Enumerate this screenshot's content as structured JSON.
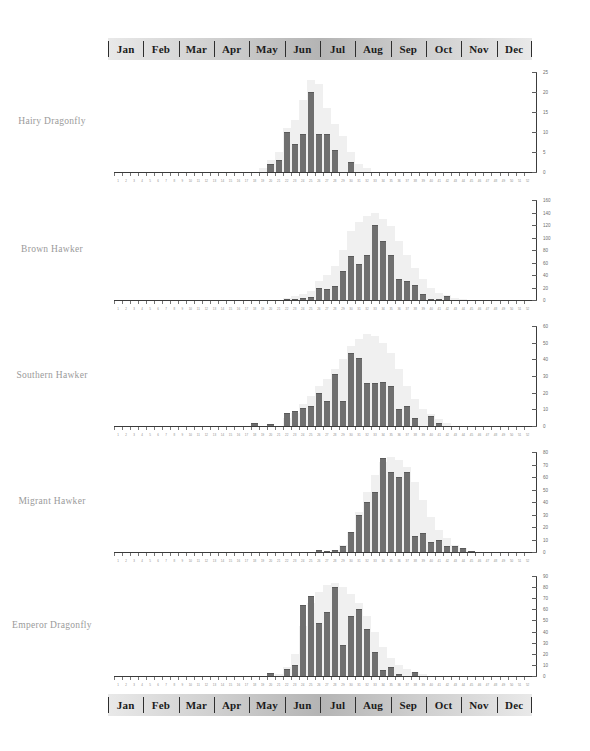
{
  "header": {
    "months": [
      "Jan",
      "Feb",
      "Mar",
      "Apr",
      "May",
      "Jun",
      "Jul",
      "Aug",
      "Sep",
      "Oct",
      "Nov",
      "Dec"
    ]
  },
  "footer": {
    "months": [
      "Jan",
      "Feb",
      "Mar",
      "Apr",
      "May",
      "Jun",
      "Jul",
      "Aug",
      "Sep",
      "Oct",
      "Nov",
      "Dec"
    ]
  },
  "colors": {
    "bar": "#6f6f6f",
    "halo": "#f0f0f0",
    "axis": "#3c3c3c",
    "label": "#9a9a9a",
    "bar_stroke": "#5a5a5a"
  },
  "chart_data": [
    {
      "type": "bar",
      "title": "Hairy Dragonfly",
      "xlabel": "",
      "ylabel": "",
      "ylim": [
        0,
        25
      ],
      "yticks": [
        0,
        5,
        10,
        15,
        20,
        25
      ],
      "grid": false,
      "categories": [
        "1",
        "2",
        "3",
        "4",
        "5",
        "6",
        "7",
        "8",
        "9",
        "10",
        "11",
        "12",
        "13",
        "14",
        "15",
        "16",
        "17",
        "18",
        "19",
        "20",
        "21",
        "22",
        "23",
        "24",
        "25",
        "26",
        "27",
        "28",
        "29",
        "30",
        "31",
        "32",
        "33",
        "34",
        "35",
        "36",
        "37",
        "38",
        "39",
        "40",
        "41",
        "42",
        "43",
        "44",
        "45",
        "46",
        "47",
        "48",
        "49",
        "50",
        "51",
        "52"
      ],
      "values": [
        0,
        0,
        0,
        0,
        0,
        0,
        0,
        0,
        0,
        0,
        0,
        0,
        0,
        0,
        0,
        0,
        0,
        0,
        0,
        2,
        3,
        10,
        7,
        9.5,
        20,
        9.5,
        9.5,
        5.5,
        0,
        2.5,
        0,
        0,
        0,
        0,
        0,
        0,
        0,
        0,
        0,
        0,
        0,
        0,
        0,
        0,
        0,
        0,
        0,
        0,
        0,
        0,
        0,
        0
      ],
      "envelope": [
        0,
        0,
        0,
        0,
        0,
        0,
        0,
        0,
        0,
        0,
        0,
        0,
        0,
        0,
        0,
        0,
        0,
        0,
        1,
        3,
        5,
        11,
        13,
        18,
        23,
        22,
        16,
        12,
        9,
        5,
        2,
        1,
        0,
        0,
        0,
        0,
        0,
        0,
        0,
        0,
        0,
        0,
        0,
        0,
        0,
        0,
        0,
        0,
        0,
        0,
        0,
        0
      ]
    },
    {
      "type": "bar",
      "title": "Brown Hawker",
      "xlabel": "",
      "ylabel": "",
      "ylim": [
        0,
        160
      ],
      "yticks": [
        0,
        20,
        40,
        60,
        80,
        100,
        120,
        140,
        160
      ],
      "grid": false,
      "categories": [
        "1",
        "2",
        "3",
        "4",
        "5",
        "6",
        "7",
        "8",
        "9",
        "10",
        "11",
        "12",
        "13",
        "14",
        "15",
        "16",
        "17",
        "18",
        "19",
        "20",
        "21",
        "22",
        "23",
        "24",
        "25",
        "26",
        "27",
        "28",
        "29",
        "30",
        "31",
        "32",
        "33",
        "34",
        "35",
        "36",
        "37",
        "38",
        "39",
        "40",
        "41",
        "42",
        "43",
        "44",
        "45",
        "46",
        "47",
        "48",
        "49",
        "50",
        "51",
        "52"
      ],
      "values": [
        0,
        0,
        0,
        0,
        0,
        0,
        0,
        0,
        0,
        0,
        0,
        0,
        0,
        0,
        0,
        0,
        0,
        0,
        0,
        0,
        0,
        2,
        2,
        4,
        5,
        20,
        17,
        22,
        46,
        70,
        58,
        72,
        120,
        94,
        72,
        34,
        31,
        24,
        10,
        2,
        2,
        6,
        0,
        0,
        0,
        0,
        0,
        0,
        0,
        0,
        0,
        0
      ],
      "envelope": [
        0,
        0,
        0,
        0,
        0,
        0,
        0,
        0,
        0,
        0,
        0,
        0,
        0,
        0,
        0,
        0,
        0,
        0,
        0,
        0,
        0,
        4,
        6,
        9,
        14,
        30,
        40,
        55,
        80,
        110,
        125,
        135,
        140,
        130,
        118,
        95,
        72,
        52,
        34,
        20,
        12,
        8,
        4,
        2,
        0,
        0,
        0,
        0,
        0,
        0,
        0,
        0
      ]
    },
    {
      "type": "bar",
      "title": "Southern Hawker",
      "xlabel": "",
      "ylabel": "",
      "ylim": [
        0,
        60
      ],
      "yticks": [
        0,
        10,
        20,
        30,
        40,
        50,
        60
      ],
      "grid": false,
      "categories": [
        "1",
        "2",
        "3",
        "4",
        "5",
        "6",
        "7",
        "8",
        "9",
        "10",
        "11",
        "12",
        "13",
        "14",
        "15",
        "16",
        "17",
        "18",
        "19",
        "20",
        "21",
        "22",
        "23",
        "24",
        "25",
        "26",
        "27",
        "28",
        "29",
        "30",
        "31",
        "32",
        "33",
        "34",
        "35",
        "36",
        "37",
        "38",
        "39",
        "40",
        "41",
        "42",
        "43",
        "44",
        "45",
        "46",
        "47",
        "48",
        "49",
        "50",
        "51",
        "52"
      ],
      "values": [
        0,
        0,
        0,
        0,
        0,
        0,
        0,
        0,
        0,
        0,
        0,
        0,
        0,
        0,
        0,
        0,
        0,
        2,
        0,
        1,
        0,
        8,
        9,
        11,
        12,
        20,
        15,
        31,
        15,
        44,
        41,
        26,
        26,
        26.5,
        24,
        10,
        12,
        5,
        0,
        6,
        2,
        0,
        0,
        0,
        0,
        0,
        0,
        0,
        0,
        0,
        0,
        0
      ],
      "envelope": [
        0,
        0,
        0,
        0,
        0,
        0,
        0,
        0,
        0,
        0,
        0,
        0,
        0,
        0,
        0,
        0,
        0,
        0,
        0,
        0,
        0,
        5,
        8,
        13,
        18,
        24,
        28,
        34,
        40,
        48,
        52,
        55,
        54,
        50,
        44,
        34,
        24,
        16,
        10,
        7,
        4,
        2,
        0,
        0,
        0,
        0,
        0,
        0,
        0,
        0,
        0,
        0
      ]
    },
    {
      "type": "bar",
      "title": "Migrant Hawker",
      "xlabel": "",
      "ylabel": "",
      "ylim": [
        0,
        80
      ],
      "yticks": [
        0,
        10,
        20,
        30,
        40,
        50,
        60,
        70,
        80
      ],
      "grid": false,
      "categories": [
        "1",
        "2",
        "3",
        "4",
        "5",
        "6",
        "7",
        "8",
        "9",
        "10",
        "11",
        "12",
        "13",
        "14",
        "15",
        "16",
        "17",
        "18",
        "19",
        "20",
        "21",
        "22",
        "23",
        "24",
        "25",
        "26",
        "27",
        "28",
        "29",
        "30",
        "31",
        "32",
        "33",
        "34",
        "35",
        "36",
        "37",
        "38",
        "39",
        "40",
        "41",
        "42",
        "43",
        "44",
        "45",
        "46",
        "47",
        "48",
        "49",
        "50",
        "51",
        "52"
      ],
      "values": [
        0,
        0,
        0,
        0,
        0,
        0,
        0,
        0,
        0,
        0,
        0,
        0,
        0,
        0,
        0,
        0,
        0,
        0,
        0,
        0,
        0,
        0,
        0,
        0,
        0,
        2,
        1,
        2,
        5,
        16,
        30,
        40,
        48,
        75,
        64,
        60,
        64,
        13,
        15,
        8,
        10,
        5,
        5,
        3,
        1,
        0,
        0,
        0,
        0,
        0,
        0,
        0
      ],
      "envelope": [
        0,
        0,
        0,
        0,
        0,
        0,
        0,
        0,
        0,
        0,
        0,
        0,
        0,
        0,
        0,
        0,
        0,
        0,
        0,
        0,
        0,
        0,
        0,
        0,
        0,
        0,
        0,
        2,
        6,
        16,
        32,
        48,
        62,
        72,
        76,
        74,
        68,
        56,
        42,
        28,
        18,
        11,
        6,
        3,
        1,
        0,
        0,
        0,
        0,
        0,
        0,
        0
      ]
    },
    {
      "type": "bar",
      "title": "Emperor  Dragonfly",
      "xlabel": "",
      "ylabel": "",
      "ylim": [
        0,
        90
      ],
      "yticks": [
        0,
        10,
        20,
        30,
        40,
        50,
        60,
        70,
        80,
        90
      ],
      "grid": false,
      "categories": [
        "1",
        "2",
        "3",
        "4",
        "5",
        "6",
        "7",
        "8",
        "9",
        "10",
        "11",
        "12",
        "13",
        "14",
        "15",
        "16",
        "17",
        "18",
        "19",
        "20",
        "21",
        "22",
        "23",
        "24",
        "25",
        "26",
        "27",
        "28",
        "29",
        "30",
        "31",
        "32",
        "33",
        "34",
        "35",
        "36",
        "37",
        "38",
        "39",
        "40",
        "41",
        "42",
        "43",
        "44",
        "45",
        "46",
        "47",
        "48",
        "49",
        "50",
        "51",
        "52"
      ],
      "values": [
        0,
        0,
        0,
        0,
        0,
        0,
        0,
        0,
        0,
        0,
        0,
        0,
        0,
        0,
        0,
        0,
        0,
        0,
        0,
        3,
        0,
        6,
        10,
        64,
        72,
        48,
        58,
        80,
        28,
        54,
        60,
        42,
        22,
        5,
        8,
        2,
        0,
        4,
        0,
        0,
        0,
        0,
        0,
        0,
        0,
        0,
        0,
        0,
        0,
        0,
        0,
        0
      ],
      "envelope": [
        0,
        0,
        0,
        0,
        0,
        0,
        0,
        0,
        0,
        0,
        0,
        0,
        0,
        0,
        0,
        0,
        0,
        0,
        0,
        0,
        2,
        8,
        20,
        45,
        66,
        76,
        82,
        84,
        80,
        74,
        66,
        54,
        40,
        26,
        16,
        10,
        6,
        4,
        2,
        0,
        0,
        0,
        0,
        0,
        0,
        0,
        0,
        0,
        0,
        0,
        0,
        0
      ]
    }
  ],
  "week_labels": [
    "1",
    "2",
    "3",
    "4",
    "5",
    "6",
    "7",
    "8",
    "9",
    "10",
    "11",
    "12",
    "13",
    "14",
    "15",
    "16",
    "17",
    "18",
    "19",
    "20",
    "21",
    "22",
    "23",
    "24",
    "25",
    "26",
    "27",
    "28",
    "29",
    "30",
    "31",
    "32",
    "33",
    "34",
    "35",
    "36",
    "37",
    "38",
    "39",
    "40",
    "41",
    "42",
    "43",
    "44",
    "45",
    "46",
    "47",
    "48",
    "49",
    "50",
    "51",
    "52"
  ]
}
